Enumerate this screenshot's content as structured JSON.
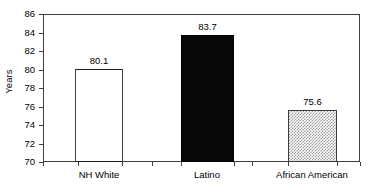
{
  "chart_data": {
    "type": "bar",
    "title": "",
    "xlabel": "",
    "ylabel": "Years",
    "categories": [
      "NH White",
      "Latino",
      "African American"
    ],
    "values": [
      80.1,
      83.7,
      75.6
    ],
    "value_labels": [
      "80.1",
      "83.7",
      "75.6"
    ],
    "ylim": [
      70,
      86
    ],
    "yticks": [
      86,
      84,
      82,
      80,
      78,
      76,
      74,
      72,
      70
    ],
    "ytick_labels": [
      "86",
      "84",
      "82",
      "80",
      "78",
      "76",
      "74",
      "72",
      "70"
    ],
    "grid": false,
    "legend": null,
    "bar_styles": [
      "white-fill-black-outline",
      "solid-black",
      "gray-checkered"
    ],
    "colors": {
      "axis": "#3f3f3f",
      "text": "#000000",
      "bar_white": "#ffffff",
      "bar_black": "#080808",
      "bar_check": "#9a9a9a",
      "background": "#ffffff"
    }
  }
}
